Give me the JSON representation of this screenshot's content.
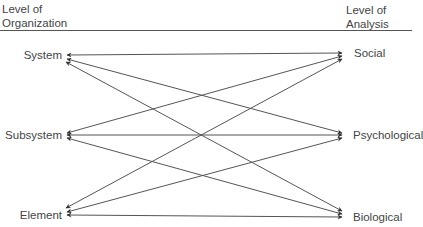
{
  "headers": {
    "left": {
      "line1": "Level of",
      "line2": "Organization"
    },
    "right": {
      "line1": "Level of",
      "line2": "Analysis"
    }
  },
  "left_nodes": [
    {
      "id": "system",
      "label": "System"
    },
    {
      "id": "subsystem",
      "label": "Subsystem"
    },
    {
      "id": "element",
      "label": "Element"
    }
  ],
  "right_nodes": [
    {
      "id": "social",
      "label": "Social"
    },
    {
      "id": "psychological",
      "label": "Psychological"
    },
    {
      "id": "biological",
      "label": "Biological"
    }
  ],
  "edges": [
    {
      "from": "System",
      "to": "Social",
      "bidirectional": true
    },
    {
      "from": "System",
      "to": "Psychological",
      "bidirectional": true
    },
    {
      "from": "System",
      "to": "Biological",
      "bidirectional": true
    },
    {
      "from": "Subsystem",
      "to": "Social",
      "bidirectional": true
    },
    {
      "from": "Subsystem",
      "to": "Psychological",
      "bidirectional": true
    },
    {
      "from": "Subsystem",
      "to": "Biological",
      "bidirectional": true
    },
    {
      "from": "Element",
      "to": "Social",
      "bidirectional": true
    },
    {
      "from": "Element",
      "to": "Psychological",
      "bidirectional": true
    },
    {
      "from": "Element",
      "to": "Biological",
      "bidirectional": true
    }
  ],
  "colors": {
    "line": "#555555",
    "text": "#444444"
  }
}
